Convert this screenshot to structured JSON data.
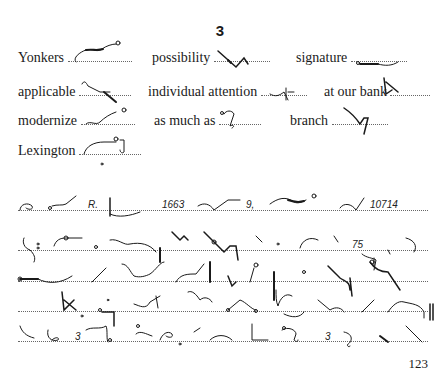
{
  "header": {
    "lesson_number": "3"
  },
  "vocabulary": [
    {
      "word": "Yonkers",
      "x": 18,
      "y": 55,
      "dots": 60
    },
    {
      "word": "possibility",
      "x": 152,
      "y": 55,
      "dots": 60
    },
    {
      "word": "signature",
      "x": 296,
      "y": 55,
      "dots": 60
    },
    {
      "word": "applicable",
      "x": 18,
      "y": 88,
      "dots": 52
    },
    {
      "word": "individual attention",
      "x": 148,
      "y": 88,
      "dots": 28
    },
    {
      "word": "at our bank",
      "x": 324,
      "y": 88,
      "dots": 44
    },
    {
      "word": "modernize",
      "x": 18,
      "y": 116,
      "dots": 54
    },
    {
      "word": "as much as",
      "x": 154,
      "y": 116,
      "dots": 44
    },
    {
      "word": "branch",
      "x": 290,
      "y": 116,
      "dots": 56
    },
    {
      "word": "Lexington",
      "x": 18,
      "y": 146,
      "dots": 62
    }
  ],
  "shorthand_lines": [
    {
      "baseline_y": 210,
      "inline_text": [
        {
          "text": "R.",
          "x": 88
        },
        {
          "text": "1663",
          "x": 162
        },
        {
          "text": "9,",
          "x": 246
        },
        {
          "text": "10714",
          "x": 370
        }
      ]
    },
    {
      "baseline_y": 250,
      "inline_text": [
        {
          "text": "75",
          "x": 352
        }
      ]
    },
    {
      "baseline_y": 281,
      "inline_text": []
    },
    {
      "baseline_y": 311,
      "inline_text": []
    },
    {
      "baseline_y": 341,
      "inline_text": [
        {
          "text": "3",
          "x": 75
        },
        {
          "text": "3",
          "x": 325
        }
      ]
    }
  ],
  "footer": {
    "page_number": "123"
  }
}
